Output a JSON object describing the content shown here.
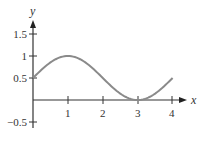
{
  "chart_data": {
    "type": "line",
    "title": "",
    "xlabel": "x",
    "ylabel": "y",
    "xlim": [
      0,
      4
    ],
    "ylim": [
      -0.5,
      1.5
    ],
    "grid": false,
    "legend": null,
    "x_ticks": [
      "1",
      "2",
      "3",
      "4"
    ],
    "y_ticks": [
      "1.5",
      "1",
      "0.5",
      "-0.5"
    ],
    "series": [
      {
        "name": "f(x)",
        "function_hint": "y = 0.5 + 0.5*sin(pi*x/2)",
        "x": [
          0,
          0.5,
          1,
          1.5,
          2,
          2.5,
          3,
          3.5,
          4
        ],
        "values": [
          0.5,
          0.854,
          1.0,
          0.854,
          0.5,
          0.146,
          0.0,
          0.146,
          0.5
        ]
      }
    ],
    "colors": {
      "curve": "#8a8a8a",
      "axes": "#333333"
    }
  },
  "axes": {
    "x_label": "x",
    "y_label": "y",
    "x_tick_labels": [
      "1",
      "2",
      "3",
      "4"
    ],
    "y_tick_labels": [
      "1.5",
      "1",
      "0.5",
      "−0.5"
    ]
  }
}
